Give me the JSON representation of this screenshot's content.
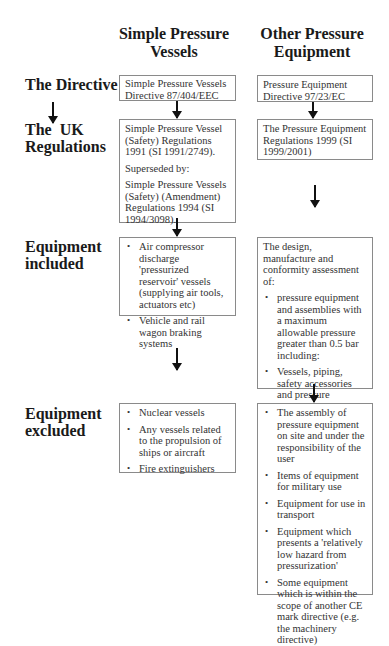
{
  "columns": {
    "simple": {
      "title_line1": "Simple Pressure",
      "title_line2": "Vessels"
    },
    "other": {
      "title_line1": "Other Pressure",
      "title_line2": "Equipment"
    }
  },
  "rows": {
    "directive": {
      "label": "The Directive"
    },
    "uk_regulations": {
      "label_line1": "The  UK",
      "label_line2": "Regulations"
    },
    "included": {
      "label_line1": "Equipment",
      "label_line2": "included"
    },
    "excluded": {
      "label_line1": "Equipment",
      "label_line2": "excluded"
    }
  },
  "simple": {
    "directive": {
      "line1": "Simple Pressure Vessels",
      "line2": "Directive 87/404/EEC"
    },
    "regulations": {
      "p1": "Simple Pressure Vessel (Safety) Regulations 1991 (SI 1991/2749).",
      "p2": "Superseded by:",
      "p3": "Simple Pressure Vessels (Safety) (Amendment) Regulations 1994 (SI 1994/3098)."
    },
    "included": [
      "Air compressor discharge 'pressurized reservoir' vessels (supplying air tools, actuators etc)",
      "Vehicle and rail wagon braking systems"
    ],
    "excluded": [
      "Nuclear vessels",
      "Any vessels related to the propulsion of ships or aircraft",
      "Fire extinguishers"
    ]
  },
  "other": {
    "directive": {
      "line1": "Pressure Equipment",
      "line2": "Directive 97/23/EC"
    },
    "regulations": {
      "p1": "The Pressure Equipment Regulations 1999 (SI 1999/2001)"
    },
    "included_intro": "The design, manufacture and conformity assessment of:",
    "included": [
      "pressure equipment and assemblies with a maximum allowable pressure greater than 0.5 bar including:",
      "Vessels, piping, safety accessories and pressure accessories",
      "Components and sub assemblies"
    ],
    "excluded": [
      "The assembly of pressure equipment on site and under the responsibility of the user",
      "Items of equipment for military use",
      "Equipment for use in transport",
      "Equipment which presents a 'relatively low hazard from pressurization'",
      "Some equipment  which is within the scope of another CE mark directive (e.g. the machinery directive)"
    ]
  }
}
